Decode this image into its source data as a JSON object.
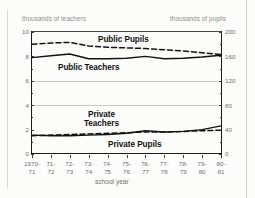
{
  "chart_data": {
    "type": "line",
    "title": "",
    "xlabel": "school year",
    "ylabel_left": "thousands of teachers",
    "ylabel_right": "thousands of pupils",
    "grid": true,
    "legend_position": "inline-annotations",
    "categories": [
      "1970-71",
      "71-72",
      "72-73",
      "73-74",
      "74-75",
      "75-76",
      "76-77",
      "77-78",
      "78-79",
      "79-80",
      "80-81"
    ],
    "x_tick_labels_line1": [
      "1970-",
      "71-",
      "72-",
      "73-",
      "74-",
      "75-",
      "76-",
      "77-",
      "78-",
      "79-",
      "80-"
    ],
    "x_tick_labels_line2": [
      "71",
      "72",
      "73",
      "74",
      "75",
      "76",
      "77",
      "78",
      "79",
      "80",
      "81"
    ],
    "y_left_ticks": [
      0,
      2,
      4,
      6,
      8,
      10
    ],
    "y_left_tick_labels": [
      "0",
      "2",
      "4",
      "6",
      "8",
      "10"
    ],
    "y_left_lim": [
      0,
      10
    ],
    "y_right_ticks": [
      0,
      40,
      80,
      120,
      160,
      200
    ],
    "y_right_tick_labels": [
      "0",
      "40",
      "80",
      "120",
      "160",
      "200"
    ],
    "y_right_lim": [
      0,
      200
    ],
    "gridline_values_left": [
      4,
      6
    ],
    "series": [
      {
        "name": "Public Pupils",
        "axis": "right",
        "style": "dashed",
        "label": "Public Pupils",
        "values": [
          180,
          182,
          183,
          177,
          175,
          174,
          173,
          171,
          169,
          166,
          163
        ]
      },
      {
        "name": "Public Teachers",
        "axis": "left",
        "style": "solid",
        "label": "Public Teachers",
        "values": [
          7.9,
          8.05,
          8.2,
          7.8,
          7.8,
          7.85,
          8.0,
          7.8,
          7.85,
          7.95,
          8.1
        ]
      },
      {
        "name": "Private Teachers",
        "axis": "left",
        "style": "solid",
        "label": "Private Teachers",
        "label_line1": "Private",
        "label_line2": "Teachers",
        "values": [
          1.55,
          1.5,
          1.5,
          1.55,
          1.6,
          1.7,
          1.9,
          1.8,
          1.85,
          2.0,
          2.3
        ]
      },
      {
        "name": "Private Pupils",
        "axis": "right",
        "style": "dashed",
        "label": "Private Pupils",
        "values": [
          30,
          31,
          32,
          33,
          34,
          35,
          36,
          36,
          37,
          38,
          39
        ]
      }
    ],
    "colors": {
      "line": "#121212",
      "gridline": "#c9c9c7",
      "axis": "#1a1a1a",
      "tick_text": "#6e6e6c",
      "axis_title_text": "#8e8e8c",
      "series_label_text": "#111111",
      "background": "#fcfcfb"
    }
  }
}
